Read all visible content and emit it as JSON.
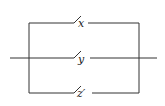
{
  "diagram": {
    "type": "switching-circuit",
    "topology": "parallel",
    "switches": [
      {
        "label": "x",
        "branch": "top"
      },
      {
        "label": "y",
        "branch": "middle"
      },
      {
        "label": "z′",
        "branch": "bottom"
      }
    ],
    "colors": {
      "line": "#333333",
      "background": "#ffffff"
    }
  }
}
